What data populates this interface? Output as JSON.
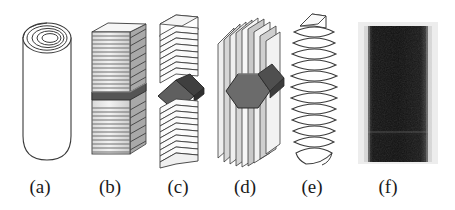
{
  "figure": {
    "background_color": "#ffffff",
    "stroke_color": "#2b2b2b",
    "fill_light": "#f2f2f2",
    "fill_mid": "#b8b8b8",
    "fill_dark": "#6e6e6e",
    "fill_darker": "#4a4a4a",
    "micrograph_color": "#1b1b1b",
    "panel_count": 6
  },
  "panels": [
    {
      "id": "a",
      "label": "(a)",
      "name": "rolled-scroll-cylinder",
      "description": "Rolled-up scroll cylinder seen in perspective with concentric spiral rings at the open top end",
      "ring_count": 4,
      "body": "open-ended tube with rounded bottom",
      "shading": "outline only",
      "label_x": 40,
      "label_y": 176
    },
    {
      "id": "b",
      "label": "(b)",
      "name": "stacked-flat-plate-column",
      "description": "Column of stacked flat parallel plates with a dark band layer near the middle",
      "layer_count": 34,
      "marker": "dark horizontal band",
      "shading": "hatched grey layers",
      "label_x": 110,
      "label_y": 176
    },
    {
      "id": "c",
      "label": "(c)",
      "name": "stacked-chevron-plate-column",
      "description": "Column of stacked V-shaped chevron folded plates with a dark diamond cross-section in the middle",
      "layer_count": 24,
      "marker": "dark diamond",
      "shading": "line drawing with grey edges",
      "label_x": 178,
      "label_y": 176
    },
    {
      "id": "d",
      "label": "(d)",
      "name": "radial-fin-plate-column",
      "description": "Vertical parallel fin plates arranged radially around a large dark hexagonal core",
      "fin_count": 9,
      "marker": "dark hexagon core",
      "shading": "grey shaded fins",
      "label_x": 245,
      "label_y": 176
    },
    {
      "id": "e",
      "label": "(e)",
      "name": "helical-coil-spiral",
      "description": "Helical coil / screw-like spiral wound into a cylinder with a flag tab at the top",
      "turn_count": 12,
      "marker": "top flag tab",
      "shading": "outline only",
      "label_x": 312,
      "label_y": 176
    },
    {
      "id": "f",
      "label": "(f)",
      "name": "electron-micrograph",
      "description": "Dark electron micrograph of a cylindrical fibre with lighter vertical edges and a faint horizontal seam near the bottom",
      "marker": "vertical bright edges",
      "shading": "photographic greyscale",
      "label_x": 388,
      "label_y": 176
    }
  ]
}
